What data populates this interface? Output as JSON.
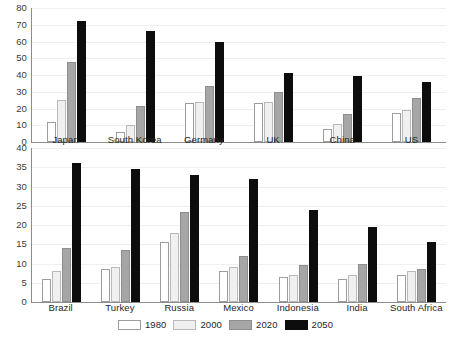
{
  "legend": {
    "position": "bottom-center",
    "entries": [
      {
        "label": "1980",
        "key": "s1980",
        "color": "#ffffff"
      },
      {
        "label": "2000",
        "key": "s2000",
        "color": "#f0f0f0"
      },
      {
        "label": "2020",
        "key": "s2020",
        "color": "#a6a6a6"
      },
      {
        "label": "2050",
        "key": "s2050",
        "color": "#0d0d0d"
      }
    ]
  },
  "chart_data": [
    {
      "type": "bar",
      "title": "",
      "xlabel": "",
      "ylabel": "",
      "ylim": [
        0,
        80
      ],
      "yticks": [
        0,
        10,
        20,
        30,
        40,
        50,
        60,
        70,
        80
      ],
      "ytick_labels": [
        "0",
        "10",
        "20",
        "30",
        "40",
        "50",
        "60",
        "70",
        "80"
      ],
      "grid": true,
      "categories": [
        "Japan",
        "South Korea",
        "Germany",
        "UK",
        "China",
        "US"
      ],
      "series": [
        {
          "name": "1980",
          "values": [
            12,
            6,
            23,
            23,
            8,
            17.5
          ]
        },
        {
          "name": "2000",
          "values": [
            25,
            10,
            24,
            24,
            10.5,
            19
          ]
        },
        {
          "name": "2020",
          "values": [
            48,
            21.5,
            33.5,
            30,
            17,
            26
          ]
        },
        {
          "name": "2050",
          "values": [
            72,
            66,
            60,
            41.5,
            39.5,
            36
          ]
        }
      ]
    },
    {
      "type": "bar",
      "title": "",
      "xlabel": "",
      "ylabel": "",
      "ylim": [
        0,
        40
      ],
      "yticks": [
        0,
        5,
        10,
        15,
        20,
        25,
        30,
        35,
        40
      ],
      "ytick_labels": [
        "0",
        "5",
        "10",
        "15",
        "20",
        "25",
        "30",
        "35",
        "40"
      ],
      "grid": true,
      "categories": [
        "Brazil",
        "Turkey",
        "Russia",
        "Mexico",
        "Indonesia",
        "India",
        "South Africa"
      ],
      "series": [
        {
          "name": "1980",
          "values": [
            6,
            8.5,
            15.5,
            8,
            6.5,
            6,
            7
          ]
        },
        {
          "name": "2000",
          "values": [
            8,
            9,
            18,
            9,
            7,
            7,
            8
          ]
        },
        {
          "name": "2020",
          "values": [
            14,
            13.5,
            23.5,
            12,
            9.5,
            10,
            8.5
          ]
        },
        {
          "name": "2050",
          "values": [
            36,
            34.5,
            33,
            32,
            24,
            19.5,
            15.5
          ]
        }
      ]
    }
  ]
}
